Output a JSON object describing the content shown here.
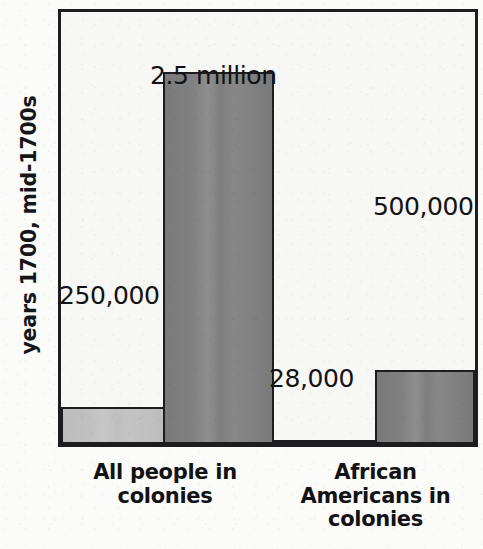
{
  "chart_data": {
    "type": "bar",
    "title": "",
    "subtitle": "",
    "xlabel": "",
    "ylabel": "years 1700, mid-1700s",
    "categories": [
      "All people in colonies",
      "African Americans in colonies"
    ],
    "category_lines": [
      [
        "All people in",
        "colonies"
      ],
      [
        "African",
        "Americans in",
        "colonies"
      ]
    ],
    "series": [
      {
        "name": "1700",
        "color": "#bdbdbd",
        "values": [
          250000,
          28000
        ],
        "value_labels": [
          "250,000",
          "28,000"
        ]
      },
      {
        "name": "mid-1700s",
        "color": "#7a7a7a",
        "values": [
          2500000,
          500000
        ],
        "value_labels": [
          "2.5 million",
          "500,000"
        ]
      }
    ],
    "bars": [
      {
        "id": "bar-all-people-1700",
        "category": "All people in colonies",
        "series": "1700",
        "value": 250000,
        "value_label": "250,000",
        "color": "#bdbdbd"
      },
      {
        "id": "bar-all-people-mid1700s",
        "category": "All people in colonies",
        "series": "mid-1700s",
        "value": 2500000,
        "value_label": "2.5 million",
        "color": "#7a7a7a"
      },
      {
        "id": "bar-african-americans-1700",
        "category": "African Americans in colonies",
        "series": "1700",
        "value": 28000,
        "value_label": "28,000",
        "color": "#bdbdbd"
      },
      {
        "id": "bar-african-americans-mid1700s",
        "category": "African Americans in colonies",
        "series": "mid-1700s",
        "value": 500000,
        "value_label": "500,000",
        "color": "#7a7a7a"
      }
    ],
    "ylim": [
      0,
      2900000
    ],
    "grid": false,
    "legend": "none",
    "axis_ticks_visible": false,
    "frame": true
  },
  "colors": {
    "light_bar": "#bdbdbd",
    "dark_bar": "#7a7a7a",
    "outline": "#1d1d1f",
    "plot_background": "#f7f7f5",
    "page_background": "#fbfbfa",
    "text": "#131316"
  }
}
